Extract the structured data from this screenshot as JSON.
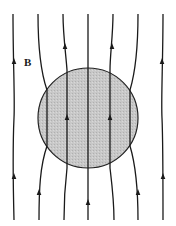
{
  "diagram": {
    "title": "",
    "field_label": "B",
    "colors": {
      "background": "#ffffff",
      "line": "#1a1a1a",
      "sphere_fill": "#c4c4c4",
      "sphere_stroke": "#222222"
    },
    "sphere": {
      "cx": 88,
      "cy": 118,
      "r": 50
    },
    "field_line_count": 7,
    "field_lines": [
      {
        "id": "line-1",
        "d": "M13,14 C13,60 15,100 14,118 C13,140 13,180 14,220",
        "arrows": [
          {
            "x": 14,
            "y": 62
          },
          {
            "x": 14,
            "y": 177
          }
        ]
      },
      {
        "id": "line-2",
        "d": "M38,14 C38,45 40,70 47,90 L47,146 C40,166 39,190 39,220",
        "arrows": [
          {
            "x": 39,
            "y": 193
          }
        ]
      },
      {
        "id": "line-3",
        "d": "M63,14 C63,35 66,55 67,70 L67,168 C65,185 64,200 64,220",
        "arrows": [
          {
            "x": 65,
            "y": 47
          },
          {
            "x": 67,
            "y": 118
          }
        ]
      },
      {
        "id": "line-4",
        "d": "M88,14 L88,220",
        "arrows": [
          {
            "x": 88,
            "y": 203
          }
        ]
      },
      {
        "id": "line-5",
        "d": "M113,14 C113,35 110,55 110,70 L110,168 C112,185 114,200 114,220",
        "arrows": [
          {
            "x": 112,
            "y": 47
          },
          {
            "x": 110,
            "y": 118
          }
        ]
      },
      {
        "id": "line-6",
        "d": "M138,14 C138,45 136,70 130,90 L130,146 C136,166 138,190 138,220",
        "arrows": [
          {
            "x": 138,
            "y": 193
          }
        ]
      },
      {
        "id": "line-7",
        "d": "M163,14 C163,60 161,100 162,118 C163,140 163,180 163,220",
        "arrows": [
          {
            "x": 162,
            "y": 62
          },
          {
            "x": 163,
            "y": 177
          }
        ]
      }
    ]
  }
}
